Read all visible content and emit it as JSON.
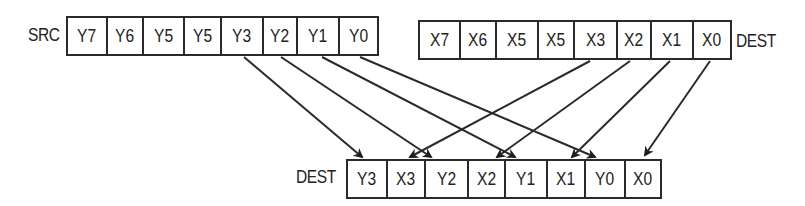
{
  "labels": {
    "src": "SRC",
    "dest_top": "DEST",
    "dest_bottom": "DEST"
  },
  "src_register": {
    "cells": [
      "Y7",
      "Y6",
      "Y5",
      "Y5",
      "Y3",
      "Y2",
      "Y1",
      "Y0"
    ]
  },
  "dest_register": {
    "cells": [
      "X7",
      "X6",
      "X5",
      "X5",
      "X3",
      "X2",
      "X1",
      "X0"
    ]
  },
  "result_register": {
    "cells": [
      "Y3",
      "X3",
      "Y2",
      "X2",
      "Y1",
      "X1",
      "Y0",
      "X0"
    ]
  },
  "arrows": [
    {
      "from": "SRC.Y3",
      "to": "DEST.Y3"
    },
    {
      "from": "SRC.Y2",
      "to": "DEST.Y2"
    },
    {
      "from": "SRC.Y1",
      "to": "DEST.Y1"
    },
    {
      "from": "SRC.Y0",
      "to": "DEST.Y0"
    },
    {
      "from": "DEST.X3",
      "to": "DEST.X3"
    },
    {
      "from": "DEST.X2",
      "to": "DEST.X2"
    },
    {
      "from": "DEST.X1",
      "to": "DEST.X1"
    },
    {
      "from": "DEST.X0",
      "to": "DEST.X0"
    }
  ],
  "colors": {
    "line": "#2a2a2a",
    "background": "#ffffff"
  }
}
